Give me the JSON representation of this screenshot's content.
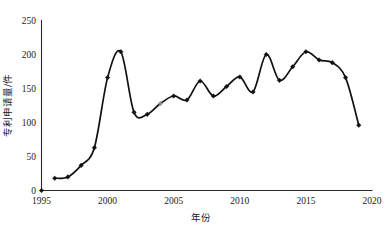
{
  "chart_data": {
    "type": "line",
    "title": "",
    "xlabel": "年份",
    "ylabel": "专利申请量/件",
    "xlim": [
      1995,
      2020
    ],
    "ylim": [
      0,
      250
    ],
    "grid": false,
    "legend": null,
    "x_ticks": [
      "1995",
      "2000",
      "2005",
      "2010",
      "2015",
      "2020"
    ],
    "x_tick_values": [
      1995,
      2000,
      2005,
      2010,
      2015,
      2020
    ],
    "y_ticks": [
      "0",
      "50",
      "100",
      "150",
      "200",
      "250"
    ],
    "y_tick_values": [
      0,
      50,
      100,
      150,
      200,
      250
    ],
    "marker": "diamond",
    "line_color": "#111111",
    "marker_color": "#111111",
    "x": [
      1996,
      1997,
      1998,
      1999,
      2000,
      2001,
      2002,
      2003,
      2004,
      2005,
      2006,
      2007,
      2008,
      2009,
      2010,
      2011,
      2012,
      2013,
      2014,
      2015,
      2016,
      2017,
      2018,
      2019
    ],
    "values": [
      18,
      20,
      37,
      63,
      166,
      204,
      115,
      112,
      128,
      139,
      133,
      161,
      139,
      153,
      167,
      145,
      200,
      162,
      182,
      204,
      192,
      188,
      166,
      96
    ],
    "series": [
      {
        "name": "专利申请量",
        "values": [
          18,
          20,
          37,
          63,
          166,
          204,
          115,
          112,
          128,
          139,
          133,
          161,
          139,
          153,
          167,
          145,
          200,
          162,
          182,
          204,
          192,
          188,
          166,
          96
        ]
      }
    ],
    "annotations": []
  },
  "axis": {
    "y_label": "专利申请量/件",
    "x_label": "年份"
  }
}
